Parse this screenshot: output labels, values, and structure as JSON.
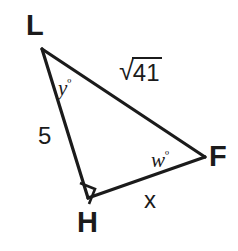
{
  "figure": {
    "kind": "geometry-diagram",
    "shape": "right-triangle",
    "background_color": "#ffffff",
    "stroke_color": "#1b1b1b",
    "text_color": "#1b1b1b",
    "stroke_width": 3
  },
  "vertices": [
    {
      "name": "L",
      "label": "L",
      "x": 42,
      "y": 49
    },
    {
      "name": "H",
      "label": "H",
      "x": 88,
      "y": 198
    },
    {
      "name": "F",
      "label": "F",
      "x": 205,
      "y": 157
    }
  ],
  "sides": [
    {
      "name": "LH",
      "label": "5",
      "from": "L",
      "to": "H"
    },
    {
      "name": "LF",
      "label": "√41",
      "radical_index": "",
      "radicand": "41",
      "from": "L",
      "to": "F"
    },
    {
      "name": "HF",
      "label": "x",
      "from": "H",
      "to": "F"
    }
  ],
  "angles": [
    {
      "name": "L",
      "label": "y",
      "degree_symbol": "º",
      "text": "yº"
    },
    {
      "name": "F",
      "label": "w",
      "degree_symbol": "º",
      "text": "wº"
    },
    {
      "name": "H",
      "label": "",
      "marker": "right-angle-square"
    }
  ],
  "labels": {
    "vertex_L": "L",
    "vertex_H": "H",
    "vertex_F": "F",
    "side_LH": "5",
    "side_HF": "x",
    "side_LF_radical_sign": "√",
    "side_LF_radicand": "41",
    "angle_L_var": "y",
    "angle_L_deg": "º",
    "angle_F_var": "w",
    "angle_F_deg": "º"
  }
}
